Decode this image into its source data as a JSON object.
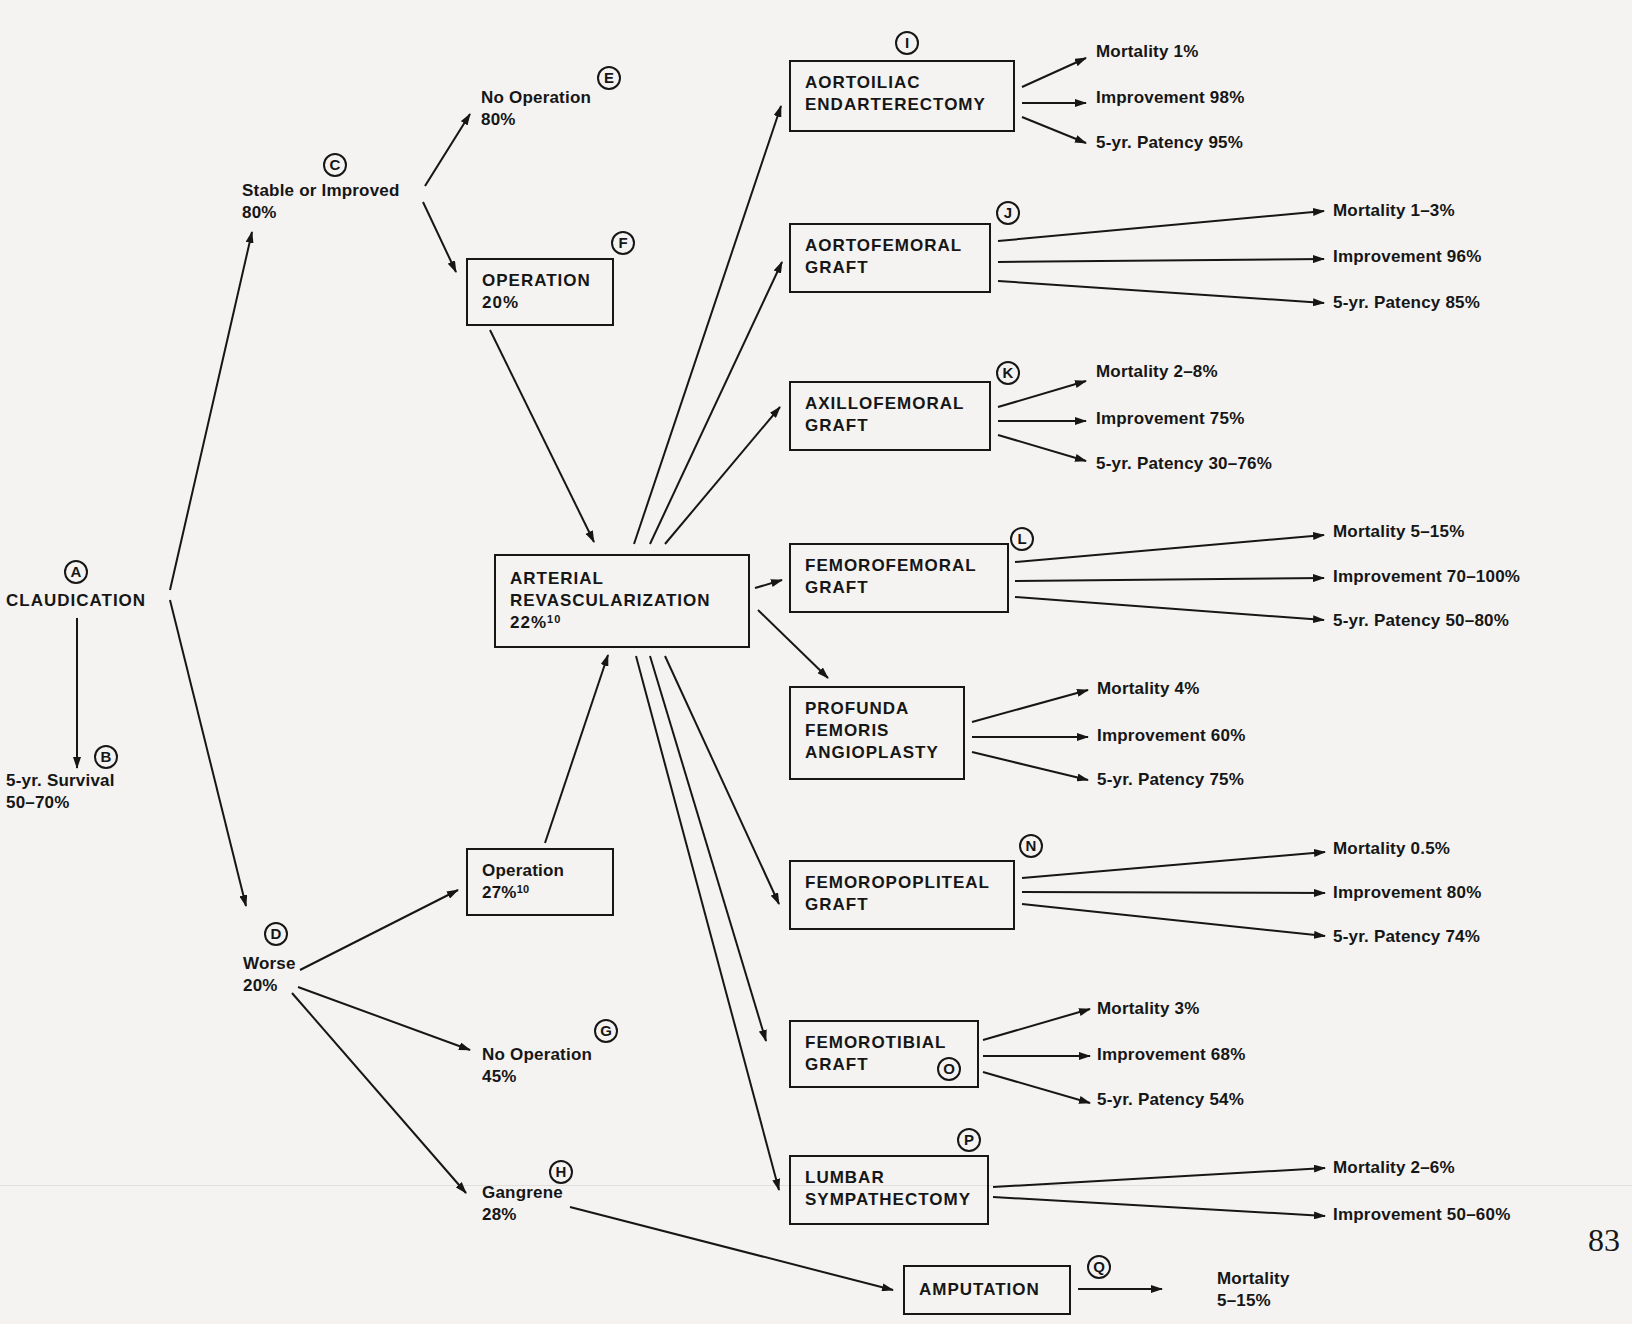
{
  "page_number": "83",
  "root": {
    "marker": "A",
    "label": "CLAUDICATION"
  },
  "survival": {
    "marker": "B",
    "line1": "5-yr. Survival",
    "line2": "50–70%"
  },
  "stable": {
    "marker": "C",
    "line1": "Stable or Improved",
    "line2": "80%"
  },
  "worse": {
    "marker": "D",
    "line1": "Worse",
    "line2": "20%"
  },
  "no_operation_stable": {
    "marker": "E",
    "line1": "No Operation",
    "line2": "80%"
  },
  "operation_stable": {
    "marker": "F",
    "line1": "OPERATION",
    "line2": "20%"
  },
  "no_operation_worse": {
    "marker": "G",
    "line1": "No Operation",
    "line2": "45%"
  },
  "gangrene": {
    "marker": "H",
    "line1": "Gangrene",
    "line2": "28%"
  },
  "operation_worse": {
    "line1": "Operation",
    "line2": "27%",
    "sup": "10"
  },
  "revascularization": {
    "line1": "ARTERIAL",
    "line2": "REVASCULARIZATION",
    "line3": "22%",
    "sup": "10"
  },
  "procedures": [
    {
      "marker": "I",
      "lines": [
        "AORTOILIAC",
        "ENDARTERECTOMY"
      ],
      "outcomes": [
        "Mortality 1%",
        "Improvement 98%",
        "5-yr. Patency 95%"
      ]
    },
    {
      "marker": "J",
      "lines": [
        "AORTOFEMORAL",
        "GRAFT"
      ],
      "outcomes": [
        "Mortality 1–3%",
        "Improvement 96%",
        "5-yr. Patency 85%"
      ]
    },
    {
      "marker": "K",
      "lines": [
        "AXILLOFEMORAL",
        "GRAFT"
      ],
      "outcomes": [
        "Mortality 2–8%",
        "Improvement 75%",
        "5-yr. Patency 30–76%"
      ]
    },
    {
      "marker": "L",
      "lines": [
        "FEMOROFEMORAL",
        "GRAFT"
      ],
      "outcomes": [
        "Mortality 5–15%",
        "Improvement 70–100%",
        "5-yr. Patency 50–80%"
      ]
    },
    {
      "marker": "",
      "lines": [
        "PROFUNDA",
        "FEMORIS",
        "ANGIOPLASTY"
      ],
      "outcomes": [
        "Mortality 4%",
        "Improvement 60%",
        "5-yr. Patency 75%"
      ]
    },
    {
      "marker": "N",
      "lines": [
        "FEMOROPOPLITEAL",
        "GRAFT"
      ],
      "outcomes": [
        "Mortality 0.5%",
        "Improvement 80%",
        "5-yr. Patency 74%"
      ]
    },
    {
      "marker": "O",
      "lines": [
        "FEMOROTIBIAL",
        "GRAFT"
      ],
      "outcomes": [
        "Mortality 3%",
        "Improvement 68%",
        "5-yr. Patency 54%"
      ]
    },
    {
      "marker": "P",
      "lines": [
        "LUMBAR",
        "SYMPATHECTOMY"
      ],
      "outcomes": [
        "Mortality 2–6%",
        "Improvement 50–60%"
      ]
    }
  ],
  "amputation": {
    "marker": "Q",
    "label": "AMPUTATION",
    "outcome_line1": "Mortality",
    "outcome_line2": "5–15%"
  }
}
